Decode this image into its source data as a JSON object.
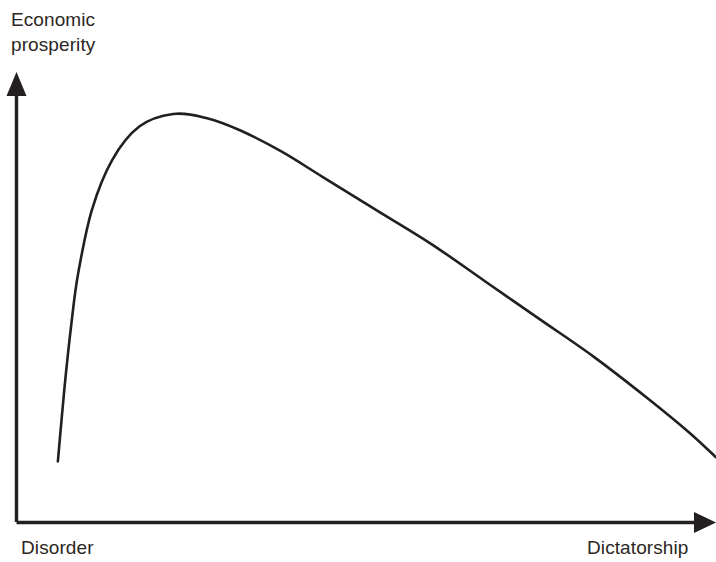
{
  "figure": {
    "background_color": "#ffffff",
    "ink_color": "#231f20",
    "axis_color": "#231f20"
  },
  "labels": {
    "y_axis_line1": "Economic",
    "y_axis_line2": "prosperity",
    "x_axis_left": "Disorder",
    "x_axis_right": "Dictatorship"
  },
  "chart_data": {
    "type": "line",
    "title": "",
    "subtitle": "",
    "xlabel": "",
    "ylabel": "",
    "x_axis_category_low": "Disorder",
    "x_axis_category_high": "Dictatorship",
    "y_axis_label_text": "Economic prosperity",
    "axis_ticks": "none",
    "grid": false,
    "legend": "none",
    "axis_arrows": [
      "y-axis-up-arrow",
      "x-axis-right-arrow"
    ],
    "xlim": [
      0,
      100
    ],
    "ylim": [
      0,
      100
    ],
    "series": [
      {
        "name": "Economic prosperity",
        "description": "Steep rise from disorder to a broad early peak, then a long gradual decline toward dictatorship",
        "x": [
          3,
          4,
          5,
          6,
          8,
          11,
          15,
          20,
          25,
          30,
          36,
          42,
          50,
          58,
          66,
          74,
          82,
          90,
          96,
          100
        ],
        "y": [
          8,
          26,
          41,
          53,
          68,
          80,
          88,
          91,
          90,
          87,
          82,
          76,
          68,
          60,
          51,
          42,
          33,
          23,
          15,
          9
        ],
        "peak": {
          "x": 21,
          "y": 91,
          "pixel_x": 158,
          "pixel_y": 114
        }
      }
    ],
    "annotations": [
      {
        "text": "Economic prosperity",
        "position": "y-axis-top"
      },
      {
        "text": "Disorder",
        "position": "x-axis-left"
      },
      {
        "text": "Dictatorship",
        "position": "x-axis-right"
      }
    ]
  }
}
